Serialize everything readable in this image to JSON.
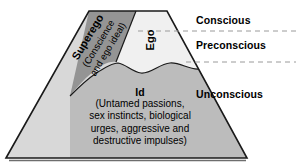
{
  "diagram": {
    "type": "freud-structural-model-trapezoid",
    "levels": [
      {
        "id": "conscious",
        "label": "Conscious"
      },
      {
        "id": "preconscious",
        "label": "Preconscious"
      },
      {
        "id": "unconscious",
        "label": "Unconscious"
      }
    ],
    "structures": {
      "superego": {
        "title": "Superego",
        "subtitle_line1": "(Conscience",
        "subtitle_line2": "and ego ideal)",
        "fill": "#949494"
      },
      "ego": {
        "title": "Ego",
        "fill": "#f0f0f0"
      },
      "id": {
        "title": "Id",
        "description_line1": "(Untamed passions,",
        "description_line2": "sex instincts, biological",
        "description_line3": "urges, aggressive and",
        "description_line4": "destructive impulses)",
        "fill": "#bcbcbc"
      }
    },
    "colors": {
      "outer_fill": "#d8d8d8",
      "outline": "#1a1a1a",
      "divider_dash": "#9a9a9a",
      "background": "#ffffff",
      "text": "#000000"
    },
    "dividers": [
      {
        "id": "conscious-preconscious-divider",
        "y": 31
      },
      {
        "id": "preconscious-unconscious-divider",
        "y": 62
      }
    ]
  }
}
